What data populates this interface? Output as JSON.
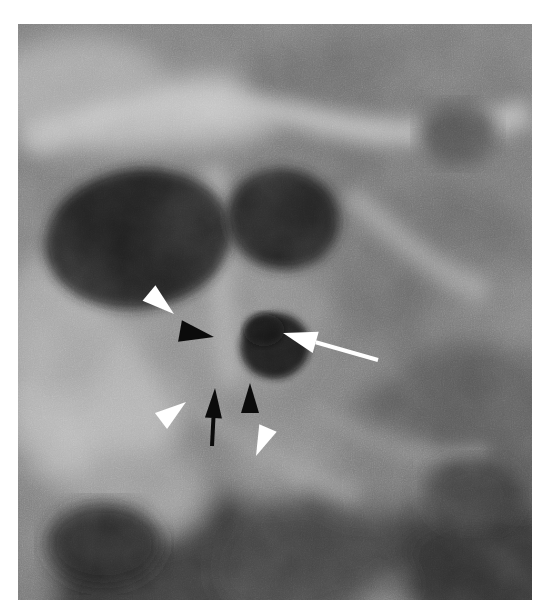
{
  "figure": {
    "kind": "electron-micrograph",
    "modality": "transmission electron microscopy",
    "title": "",
    "caption": "",
    "background_color": "#ffffff",
    "frame": {
      "x": 18,
      "y": 24,
      "width": 514,
      "height": 576,
      "border_color": "#ffffff"
    },
    "tone": {
      "darkest": "#141414",
      "dark": "#2e2e2e",
      "mid_dark": "#4d4d4d",
      "mid": "#6f6f6f",
      "mid_light": "#8e8e8e",
      "light": "#aeaeae",
      "lightest": "#cdcdcd"
    }
  },
  "structures": [
    {
      "name": "upper-left-dark-organelle",
      "description": "large dark ovoid mass, upper left",
      "cx": 120,
      "cy": 215,
      "rx": 92,
      "ry": 68,
      "fill": "#1f1f1f",
      "rotation": -8
    },
    {
      "name": "upper-center-dark-organelle",
      "description": "dark rounded mass upper centre",
      "cx": 265,
      "cy": 195,
      "rx": 56,
      "ry": 50,
      "fill": "#232323",
      "rotation": 10
    },
    {
      "name": "central-dark-vesicle",
      "description": "small dark round vesicle indicated by the white arrow",
      "cx": 257,
      "cy": 322,
      "rx": 34,
      "ry": 32,
      "fill": "#1c1c1c",
      "rotation": -12
    },
    {
      "name": "lower-left-dark-mass",
      "description": "broad dark band across the lower left quadrant",
      "cx": 150,
      "cy": 545,
      "rx": 118,
      "ry": 74,
      "fill": "#262626",
      "rotation": -20
    },
    {
      "name": "right-field-dark-band",
      "description": "diagonal darker band on the right side",
      "cx": 430,
      "cy": 430,
      "rx": 130,
      "ry": 96,
      "fill": "#4a4a4a",
      "rotation": -38
    },
    {
      "name": "upper-pale-band",
      "description": "pale horizontal band across the top",
      "cx": 170,
      "cy": 88,
      "rx": 175,
      "ry": 30,
      "fill": "#b9b9b9",
      "rotation": -6
    },
    {
      "name": "left-pale-cytoplasm",
      "description": "pale cytoplasmic region, mid left",
      "cx": 75,
      "cy": 380,
      "rx": 85,
      "ry": 82,
      "fill": "#b2b2b2",
      "rotation": 0
    }
  ],
  "annotations": {
    "legend_note": "white arrow, black arrow, two black arrowheads and three white arrowheads mark membrane structures",
    "markers": [
      {
        "id": "white-arrow-main",
        "kind": "arrow",
        "color": "#ffffff",
        "points_to": "central-dark-vesicle",
        "tip": {
          "x": 283,
          "y": 333
        },
        "tail": {
          "x": 378,
          "y": 360
        },
        "head_length": 34,
        "head_width": 22,
        "shaft_width": 4
      },
      {
        "id": "black-arrow-lower",
        "kind": "arrow",
        "color": "#0b0b0b",
        "points_to": "lower-membrane-junction",
        "tip": {
          "x": 215,
          "y": 388
        },
        "tail": {
          "x": 212,
          "y": 446
        },
        "head_length": 30,
        "head_width": 17,
        "shaft_width": 4
      },
      {
        "id": "white-arrowhead-upper-left",
        "kind": "arrowhead",
        "color": "#ffffff",
        "tip": {
          "x": 174,
          "y": 314
        },
        "base_center": {
          "x": 149,
          "y": 293
        },
        "width": 20
      },
      {
        "id": "black-arrowhead-mid",
        "kind": "arrowhead",
        "color": "#0b0b0b",
        "tip": {
          "x": 214,
          "y": 337
        },
        "base_center": {
          "x": 180,
          "y": 331
        },
        "width": 22
      },
      {
        "id": "white-arrowhead-lower-left",
        "kind": "arrowhead",
        "color": "#ffffff",
        "tip": {
          "x": 186,
          "y": 402
        },
        "base_center": {
          "x": 161,
          "y": 421
        },
        "width": 20
      },
      {
        "id": "black-arrowhead-lower-right",
        "kind": "arrowhead",
        "color": "#0b0b0b",
        "tip": {
          "x": 250,
          "y": 383
        },
        "base_center": {
          "x": 250,
          "y": 413
        },
        "width": 18
      },
      {
        "id": "white-arrowhead-bottom",
        "kind": "arrowhead",
        "color": "#ffffff",
        "tip": {
          "x": 256,
          "y": 456
        },
        "base_center": {
          "x": 268,
          "y": 428
        },
        "width": 19
      }
    ]
  }
}
